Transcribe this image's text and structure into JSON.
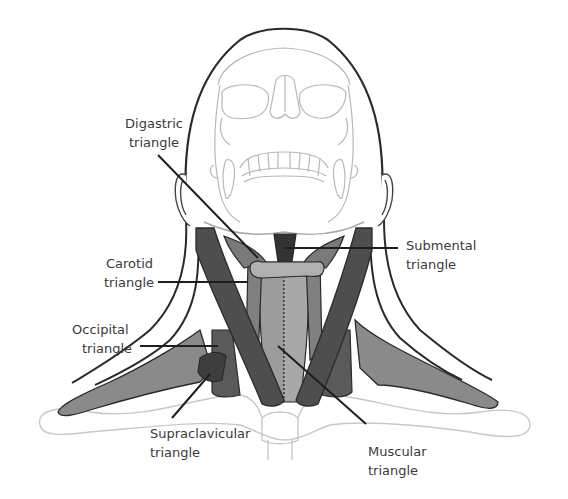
{
  "figure": {
    "colors": {
      "outline": "#2a2a2a",
      "skull_line": "#b8b8b8",
      "muscle_dark": "#4e4e4e",
      "muscle_mid": "#6e6e6e",
      "muscle_light": "#8c8c8c",
      "muscle_pale": "#a5a5a5",
      "hyoid": "#b0b0b0",
      "clavicle_line": "#c8c8c8",
      "text": "#3a3a3a"
    }
  },
  "labels": {
    "digastric": {
      "line1": "Digastric",
      "line2": "triangle"
    },
    "submental": {
      "line1": "Submental",
      "line2": "triangle"
    },
    "carotid": {
      "line1": "Carotid",
      "line2": "triangle"
    },
    "occipital": {
      "line1": "Occipital",
      "line2": "triangle"
    },
    "supraclavicular": {
      "line1": "Supraclavicular",
      "line2": "triangle"
    },
    "muscular": {
      "line1": "Muscular",
      "line2": "triangle"
    }
  }
}
